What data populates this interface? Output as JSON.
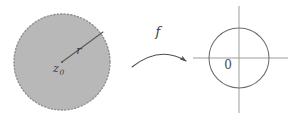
{
  "figure": {
    "colors": {
      "disk_fill": "#b8b8b8",
      "disk_edge": "#8f8f8f",
      "line": "#595959",
      "axis": "#9a9a9a",
      "circle": "#6e6e6e",
      "text": "#3a3a3a",
      "background": "#ffffff"
    },
    "left_panel": {
      "name": "source-disk",
      "shape": "dashed-filled-disk",
      "center": {
        "cx": 62,
        "cy": 62
      },
      "radius": 48,
      "center_label": "z",
      "center_label_subscript": "0",
      "radius_label": "r",
      "radius_line": {
        "x1": 62,
        "y1": 62,
        "x2": 103,
        "y2": 32
      }
    },
    "map_arrow": {
      "name": "map-arrow",
      "label": "f",
      "label_position": {
        "x": 159,
        "y": 36
      },
      "path": "M132,66 Q160,46 187,61",
      "arrowhead_at": "end"
    },
    "right_panel": {
      "name": "target-circle-plane",
      "circle": {
        "cx": 239,
        "cy": 58,
        "r": 30
      },
      "origin_label": "0",
      "origin_label_position": {
        "x": 228,
        "y": 68
      },
      "horizontal_axis": {
        "x1": 193,
        "y1": 58,
        "x2": 288,
        "y2": 58
      },
      "vertical_axis": {
        "x1": 239,
        "y1": 6,
        "x2": 239,
        "y2": 113
      }
    }
  }
}
